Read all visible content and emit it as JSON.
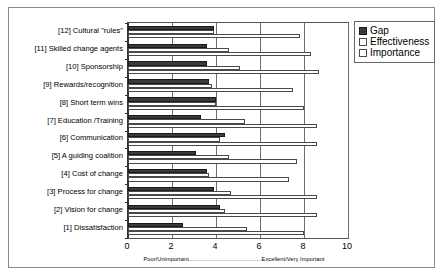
{
  "chart_data": {
    "type": "bar",
    "orientation": "horizontal",
    "title": "",
    "xlabel": "Poor/Unimportant............................................Excellent/Very Important",
    "ylabel": "",
    "xlim": [
      0,
      10
    ],
    "xticks": [
      "0",
      "2",
      "4",
      "6",
      "8",
      "10"
    ],
    "grid": true,
    "legend_position": "right",
    "categories": [
      "[12] Cultural \"rules\"",
      "[11] Skilled change agents",
      "[10] Sponsorship",
      "[9] Rewards/recognition",
      "[8] Short term wins",
      "[7] Education /Training",
      "[6] Communication",
      "[5] A guiding coalition",
      "[4] Cost of change",
      "[3] Process for change",
      "[2] Vision for change",
      "[1] Dissatisfaction"
    ],
    "series": [
      {
        "name": "Gap",
        "color": "#3a3a3a",
        "values": [
          3.9,
          3.6,
          3.6,
          3.7,
          4.0,
          3.3,
          4.4,
          3.1,
          3.6,
          3.9,
          4.2,
          2.5
        ]
      },
      {
        "name": "Effectiveness",
        "color": "#ffffff",
        "values": [
          3.9,
          4.6,
          5.1,
          3.8,
          4.0,
          5.3,
          4.2,
          4.6,
          3.7,
          4.7,
          4.4,
          5.4
        ]
      },
      {
        "name": "Importance",
        "color": "#ffffff",
        "values": [
          7.8,
          8.3,
          8.7,
          7.5,
          8.0,
          8.6,
          8.6,
          7.7,
          7.3,
          8.6,
          8.6,
          8.0
        ]
      }
    ]
  },
  "legend": {
    "items": [
      {
        "label": "Gap",
        "swatch": "filled"
      },
      {
        "label": "Effectiveness",
        "swatch": "open"
      },
      {
        "label": "Importance",
        "swatch": "open"
      }
    ]
  },
  "axis": {
    "x_caption": "Poor/Unimportant............................................Excellent/Very Important",
    "x_caption_left": "Poor/Unimportant",
    "x_caption_right": "Excellent/Very Important"
  }
}
